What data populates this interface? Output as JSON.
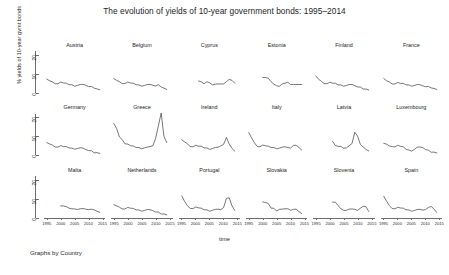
{
  "chart_data": {
    "type": "line",
    "title": "The evolution of yields of 10-year government bonds: 1995–2014",
    "xlabel": "time",
    "ylabel": "% yields of 10-year gvmt bonds",
    "caption": "Graphs by Country",
    "layout": "small-multiples 6 columns x 3 rows, shared axes",
    "grid": false,
    "legend": "none",
    "xlim": [
      1994,
      2016
    ],
    "ylim": [
      0,
      22
    ],
    "yticks": [
      0,
      10,
      20
    ],
    "ytick_labels": [
      "0",
      "10",
      "20"
    ],
    "xticks": [
      1995,
      2000,
      2005,
      2010,
      2015
    ],
    "xtick_labels": [
      "1995",
      "2000",
      "2005",
      "2010",
      "2015"
    ],
    "x": [
      1995,
      1996,
      1997,
      1998,
      1999,
      2000,
      2001,
      2002,
      2003,
      2004,
      2005,
      2006,
      2007,
      2008,
      2009,
      2010,
      2011,
      2012,
      2013,
      2014
    ],
    "series": [
      {
        "name": "Austria",
        "panel": 1,
        "values": [
          7.1,
          6.3,
          5.7,
          4.7,
          4.7,
          5.6,
          5.1,
          5.0,
          4.2,
          4.2,
          3.4,
          3.8,
          4.3,
          4.4,
          3.9,
          3.2,
          3.3,
          2.4,
          2.0,
          1.5
        ]
      },
      {
        "name": "Belgium",
        "panel": 2,
        "values": [
          7.5,
          6.5,
          5.8,
          4.8,
          4.8,
          5.6,
          5.1,
          5.0,
          4.2,
          4.1,
          3.4,
          3.8,
          4.3,
          4.4,
          3.9,
          3.5,
          4.2,
          3.0,
          2.4,
          1.7
        ]
      },
      {
        "name": "Cyprus",
        "panel": 3,
        "values": [
          null,
          null,
          null,
          null,
          null,
          null,
          6.2,
          5.7,
          4.7,
          5.8,
          5.2,
          4.1,
          4.5,
          4.6,
          4.6,
          4.6,
          5.8,
          7.0,
          6.5,
          5.0
        ]
      },
      {
        "name": "Estonia",
        "panel": 4,
        "values": [
          null,
          null,
          null,
          null,
          null,
          8.0,
          8.0,
          7.6,
          5.8,
          4.5,
          3.6,
          3.4,
          4.6,
          5.0,
          5.5,
          4.3,
          4.3,
          4.3,
          4.3,
          4.3
        ]
      },
      {
        "name": "Finland",
        "panel": 5,
        "values": [
          8.8,
          7.1,
          6.0,
          4.8,
          4.7,
          5.5,
          5.0,
          5.0,
          4.1,
          4.1,
          3.4,
          3.8,
          4.3,
          4.3,
          3.7,
          3.0,
          3.0,
          1.9,
          1.9,
          1.4
        ]
      },
      {
        "name": "France",
        "panel": 6,
        "values": [
          7.5,
          6.3,
          5.6,
          4.6,
          4.6,
          5.4,
          4.9,
          4.9,
          4.1,
          4.1,
          3.4,
          3.8,
          4.3,
          4.2,
          3.6,
          3.1,
          3.3,
          2.5,
          2.2,
          1.7
        ]
      },
      {
        "name": "Germany",
        "panel": 7,
        "values": [
          6.9,
          6.2,
          5.6,
          4.6,
          4.5,
          5.3,
          4.8,
          4.8,
          4.1,
          4.0,
          3.4,
          3.8,
          4.2,
          4.0,
          3.2,
          2.7,
          2.6,
          1.5,
          1.6,
          1.2
        ]
      },
      {
        "name": "Greece",
        "panel": 8,
        "values": [
          17.0,
          14.4,
          9.9,
          8.5,
          6.3,
          6.1,
          5.3,
          5.1,
          4.3,
          4.3,
          3.6,
          4.1,
          4.5,
          4.8,
          5.2,
          9.1,
          15.8,
          22.5,
          10.1,
          6.9
        ]
      },
      {
        "name": "Ireland",
        "panel": 9,
        "values": [
          8.3,
          7.3,
          6.3,
          4.8,
          4.7,
          5.5,
          5.0,
          5.0,
          4.1,
          4.1,
          3.3,
          3.8,
          4.3,
          4.5,
          5.2,
          6.0,
          9.6,
          6.2,
          3.8,
          2.4
        ]
      },
      {
        "name": "Italy",
        "panel": 10,
        "values": [
          12.2,
          9.4,
          6.9,
          4.9,
          4.7,
          5.6,
          5.2,
          5.0,
          4.3,
          4.3,
          3.6,
          4.0,
          4.5,
          4.7,
          4.3,
          4.0,
          5.4,
          5.5,
          4.3,
          2.9
        ]
      },
      {
        "name": "Latvia",
        "panel": 11,
        "values": [
          null,
          null,
          null,
          null,
          null,
          null,
          7.6,
          5.4,
          4.9,
          4.9,
          3.9,
          4.1,
          5.3,
          6.4,
          12.4,
          10.3,
          5.9,
          4.6,
          3.3,
          2.5
        ]
      },
      {
        "name": "Luxembourg",
        "panel": 12,
        "values": [
          6.5,
          6.1,
          5.1,
          4.8,
          4.6,
          5.5,
          4.9,
          4.7,
          3.3,
          3.0,
          2.4,
          3.3,
          4.5,
          4.6,
          4.2,
          3.2,
          2.9,
          1.8,
          1.9,
          1.4
        ]
      },
      {
        "name": "Malta",
        "panel": 13,
        "values": [
          null,
          null,
          null,
          null,
          null,
          6.2,
          6.2,
          5.8,
          5.0,
          4.7,
          4.6,
          4.3,
          4.7,
          4.8,
          4.5,
          4.2,
          4.5,
          4.1,
          3.4,
          2.8
        ]
      },
      {
        "name": "Netherlands",
        "panel": 14,
        "values": [
          6.9,
          6.2,
          5.6,
          4.6,
          4.6,
          5.4,
          5.0,
          4.9,
          4.1,
          4.1,
          3.4,
          3.8,
          4.3,
          4.2,
          3.7,
          3.0,
          3.0,
          1.9,
          2.0,
          1.5
        ]
      },
      {
        "name": "Portugal",
        "panel": 15,
        "values": [
          11.5,
          8.6,
          6.4,
          4.9,
          4.8,
          5.6,
          5.2,
          5.0,
          4.2,
          4.1,
          3.4,
          3.9,
          4.4,
          4.5,
          4.2,
          5.4,
          10.2,
          10.5,
          6.3,
          3.8
        ]
      },
      {
        "name": "Slovakia",
        "panel": 16,
        "values": [
          null,
          null,
          null,
          null,
          null,
          8.3,
          8.0,
          7.5,
          5.0,
          5.0,
          3.5,
          4.4,
          4.5,
          4.7,
          4.7,
          3.9,
          4.4,
          4.5,
          3.2,
          2.1
        ]
      },
      {
        "name": "Slovenia",
        "panel": 17,
        "values": [
          null,
          null,
          null,
          null,
          null,
          null,
          8.2,
          8.2,
          6.4,
          4.7,
          3.8,
          3.9,
          4.5,
          4.6,
          4.4,
          3.8,
          5.0,
          6.0,
          5.8,
          3.3
        ]
      },
      {
        "name": "Spain",
        "panel": 18,
        "values": [
          11.3,
          8.7,
          6.4,
          4.8,
          4.7,
          5.5,
          5.1,
          5.0,
          4.1,
          4.1,
          3.4,
          3.8,
          4.3,
          4.4,
          4.0,
          4.3,
          5.4,
          5.9,
          4.6,
          2.7
        ]
      }
    ]
  },
  "chart": {
    "title": "The evolution of yields of 10-year government bonds: 1995–2014",
    "xlabel": "time",
    "ylabel": "% yields of 10-year gvmt bonds",
    "caption": "Graphs by Country",
    "line_color": "#4a4a4a",
    "axis_color": "#6e6e6e"
  }
}
